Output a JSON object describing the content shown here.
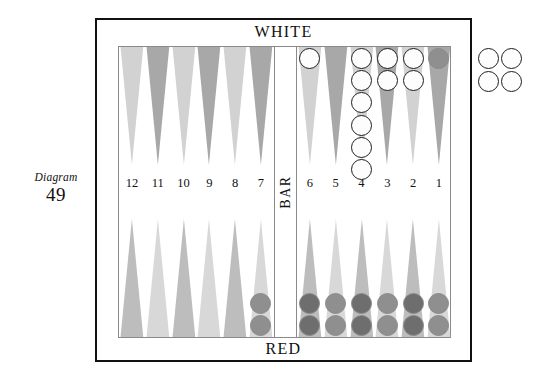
{
  "caption": {
    "word": "Diagram",
    "number": "49"
  },
  "board": {
    "top_label": "WHITE",
    "bottom_label": "RED",
    "bar_label": "BAR",
    "colors": {
      "point_light": "#d2d2d2",
      "point_dark": "#a8a8a8",
      "point_bottom_light": "#d8d8d8",
      "point_bottom_dark": "#bdbdbd",
      "checker_white_fill": "#fdfdfd",
      "checker_white_border": "#1d1d1d",
      "checker_red_fill": "#8f8f8f",
      "checker_red_dark": "#6e6e6e",
      "frame": "#111111",
      "board_border": "#8a8a8a"
    }
  },
  "points": [
    {
      "number": "12",
      "quadrant": "top-left",
      "index": 0,
      "shade": "light",
      "checkers": 0,
      "color": ""
    },
    {
      "number": "11",
      "quadrant": "top-left",
      "index": 1,
      "shade": "dark",
      "checkers": 0,
      "color": ""
    },
    {
      "number": "10",
      "quadrant": "top-left",
      "index": 2,
      "shade": "light",
      "checkers": 0,
      "color": ""
    },
    {
      "number": "9",
      "quadrant": "top-left",
      "index": 3,
      "shade": "dark",
      "checkers": 0,
      "color": ""
    },
    {
      "number": "8",
      "quadrant": "top-left",
      "index": 4,
      "shade": "light",
      "checkers": 0,
      "color": ""
    },
    {
      "number": "7",
      "quadrant": "top-left",
      "index": 5,
      "shade": "dark",
      "checkers": 0,
      "color": ""
    },
    {
      "number": "6",
      "quadrant": "top-right",
      "index": 0,
      "shade": "light",
      "checkers": 1,
      "color": "white"
    },
    {
      "number": "5",
      "quadrant": "top-right",
      "index": 1,
      "shade": "dark",
      "checkers": 0,
      "color": ""
    },
    {
      "number": "4",
      "quadrant": "top-right",
      "index": 2,
      "shade": "light",
      "checkers": 6,
      "color": "white"
    },
    {
      "number": "3",
      "quadrant": "top-right",
      "index": 3,
      "shade": "dark",
      "checkers": 2,
      "color": "white"
    },
    {
      "number": "2",
      "quadrant": "top-right",
      "index": 4,
      "shade": "light",
      "checkers": 2,
      "color": "white"
    },
    {
      "number": "1",
      "quadrant": "top-right",
      "index": 5,
      "shade": "dark",
      "checkers": 1,
      "color": "red"
    }
  ],
  "bottom_points": [
    {
      "number": "12",
      "quadrant": "bottom-left",
      "index": 0,
      "shade": "dark",
      "checkers": 0,
      "color": ""
    },
    {
      "number": "11",
      "quadrant": "bottom-left",
      "index": 1,
      "shade": "light",
      "checkers": 0,
      "color": ""
    },
    {
      "number": "10",
      "quadrant": "bottom-left",
      "index": 2,
      "shade": "dark",
      "checkers": 0,
      "color": ""
    },
    {
      "number": "9",
      "quadrant": "bottom-left",
      "index": 3,
      "shade": "light",
      "checkers": 0,
      "color": ""
    },
    {
      "number": "8",
      "quadrant": "bottom-left",
      "index": 4,
      "shade": "dark",
      "checkers": 0,
      "color": ""
    },
    {
      "number": "7",
      "quadrant": "bottom-left",
      "index": 5,
      "shade": "light",
      "checkers": 2,
      "color": "red"
    },
    {
      "number": "6",
      "quadrant": "bottom-right",
      "index": 0,
      "shade": "dark",
      "checkers": 2,
      "color": "red-dark"
    },
    {
      "number": "5",
      "quadrant": "bottom-right",
      "index": 1,
      "shade": "light",
      "checkers": 2,
      "color": "red"
    },
    {
      "number": "4",
      "quadrant": "bottom-right",
      "index": 2,
      "shade": "dark",
      "checkers": 2,
      "color": "red-dark"
    },
    {
      "number": "3",
      "quadrant": "bottom-right",
      "index": 3,
      "shade": "light",
      "checkers": 2,
      "color": "red"
    },
    {
      "number": "2",
      "quadrant": "bottom-right",
      "index": 4,
      "shade": "dark",
      "checkers": 2,
      "color": "red-dark"
    },
    {
      "number": "1",
      "quadrant": "bottom-right",
      "index": 5,
      "shade": "light",
      "checkers": 2,
      "color": "red"
    }
  ],
  "point_numbers_left": [
    "12",
    "11",
    "10",
    "9",
    "8",
    "7"
  ],
  "point_numbers_right": [
    "6",
    "5",
    "4",
    "3",
    "2",
    "1"
  ],
  "borne_off": {
    "color": "white",
    "count": 4,
    "label": "borne-off-white-checkers"
  }
}
